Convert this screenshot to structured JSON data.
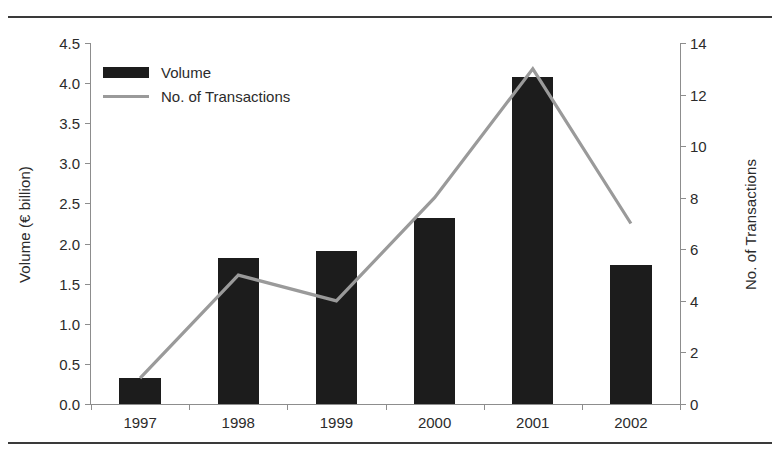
{
  "figure": {
    "frame_top_rule": "rule",
    "frame_bottom_rule": "rule"
  },
  "legend": {
    "position": "top-left-inside",
    "items": [
      {
        "label": "Volume",
        "marker": "filled-bar-swatch",
        "color": "#1c1c1c"
      },
      {
        "label": "No. of Transactions",
        "marker": "line-swatch",
        "color": "#9a9a9a"
      }
    ]
  },
  "axes": {
    "left": {
      "title": "Volume (€ billion)",
      "ticks": [
        "0.0",
        "0.5",
        "1.0",
        "1.5",
        "2.0",
        "2.5",
        "3.0",
        "3.5",
        "4.0",
        "4.5"
      ],
      "min": 0,
      "max": 4.5,
      "step": 0.5
    },
    "right": {
      "title": "No. of Transactions",
      "ticks": [
        "0",
        "2",
        "4",
        "6",
        "8",
        "10",
        "12",
        "14"
      ],
      "min": 0,
      "max": 14,
      "step": 2
    },
    "bottom": {
      "title": "",
      "ticks": [
        "1997",
        "1998",
        "1999",
        "2000",
        "2001",
        "2002"
      ]
    }
  },
  "chart_data": {
    "type": "bar",
    "title": "",
    "subtitle": "",
    "xlabel": "",
    "ylabel": "Volume (€ billion)",
    "y2label": "No. of Transactions",
    "categories": [
      "1997",
      "1998",
      "1999",
      "2000",
      "2001",
      "2002"
    ],
    "ylim": [
      0,
      4.5
    ],
    "y2lim": [
      0,
      14
    ],
    "grid": false,
    "legend_position": "upper left",
    "series": [
      {
        "name": "Volume",
        "type": "bar",
        "axis": "left",
        "unit": "€ billion",
        "color": "#1c1c1c",
        "values": [
          0.32,
          1.82,
          1.91,
          2.32,
          4.08,
          1.73
        ]
      },
      {
        "name": "No. of Transactions",
        "type": "line",
        "axis": "right",
        "unit": "transactions",
        "color": "#9a9a9a",
        "values": [
          1,
          5,
          4,
          8,
          13,
          7
        ]
      }
    ]
  }
}
